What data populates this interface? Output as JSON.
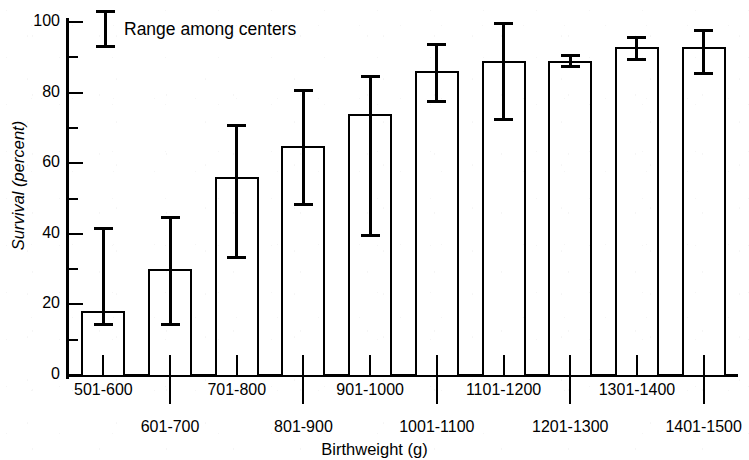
{
  "chart_data": {
    "type": "bar",
    "title": "",
    "xlabel": "Birthweight (g)",
    "ylabel": "Survival (percent)",
    "ylim": [
      0,
      100
    ],
    "y_major_ticks": [
      0,
      20,
      40,
      60,
      80,
      100
    ],
    "y_minor_ticks": [
      10,
      30,
      50,
      70,
      90
    ],
    "y_tick_labels": [
      "0",
      "20",
      "40",
      "60",
      "80",
      "100"
    ],
    "grid": false,
    "legend_position": "top-left",
    "legend_entries": [
      "Range among centers"
    ],
    "error_bar_meaning": "Range among centers",
    "categories": [
      "501-600",
      "601-700",
      "701-800",
      "801-900",
      "901-1000",
      "1001-1100",
      "1101-1200",
      "1201-1300",
      "1301-1400",
      "1401-1500"
    ],
    "values": [
      18,
      30,
      56,
      65,
      74,
      86,
      89,
      89,
      93,
      93
    ],
    "error_low": [
      14,
      14,
      33,
      48,
      39,
      77,
      72,
      87,
      89,
      85
    ],
    "error_high": [
      42,
      45,
      71,
      81,
      85,
      94,
      100,
      91,
      96,
      98
    ],
    "series": [
      {
        "name": "Survival",
        "values": [
          18,
          30,
          56,
          65,
          74,
          86,
          89,
          89,
          93,
          93
        ]
      }
    ]
  },
  "legend": {
    "label": "Range among centers"
  },
  "axes": {
    "x_title": "Birthweight (g)",
    "y_title": "Survival (percent)"
  }
}
